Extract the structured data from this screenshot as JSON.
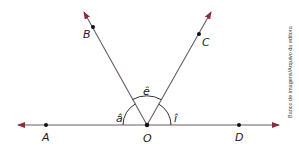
{
  "diagram": {
    "points": {
      "A": "A",
      "B": "B",
      "C": "C",
      "D": "D",
      "O": "O"
    },
    "angles": {
      "a": "â",
      "e": "ê",
      "i": "î"
    },
    "credit": "Banco de imagens/Arquivo da editora",
    "colors": {
      "line": "#6e5a62",
      "arrow": "#8c2b3c",
      "point": "#111111"
    }
  }
}
